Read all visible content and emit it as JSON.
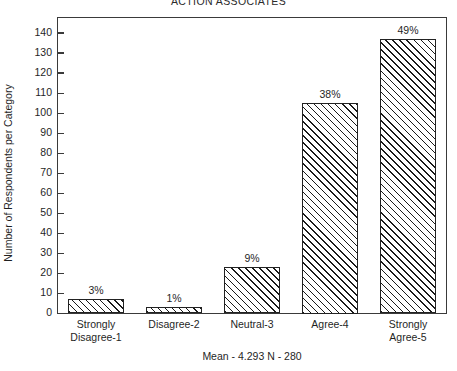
{
  "chart_data": {
    "type": "bar",
    "title": "ACTION ASSOCIATES",
    "xlabel": "",
    "ylabel": "Number of Respondents per Category",
    "categories": [
      "Strongly Disagree-1",
      "Disagree-2",
      "Neutral-3",
      "Agree-4",
      "Strongly Agree-5"
    ],
    "category_lines": [
      [
        "Strongly",
        "Disagree-1"
      ],
      [
        "Disagree-2",
        ""
      ],
      [
        "Neutral-3",
        ""
      ],
      [
        "Agree-4",
        ""
      ],
      [
        "Strongly",
        "Agree-5"
      ]
    ],
    "values": [
      7,
      3,
      23,
      105,
      137
    ],
    "data_labels": [
      "3%",
      "1%",
      "9%",
      "38%",
      "49%"
    ],
    "percentages": [
      3,
      1,
      9,
      38,
      49
    ],
    "ylim": [
      0,
      140
    ],
    "ytick_step": 10,
    "ytick_labels": [
      "140",
      "130",
      "120",
      "110",
      "100",
      "90",
      "80",
      "70",
      "60",
      "50",
      "40",
      "30",
      "20",
      "10",
      "0"
    ],
    "grid": false,
    "legend": null,
    "footnote": "Mean - 4.293  N - 280",
    "mean": 4.293,
    "n": 280,
    "bar_fill": "hatch-diagonal-45",
    "bar_edge_color": "#222222",
    "background_color": "#ffffff"
  }
}
